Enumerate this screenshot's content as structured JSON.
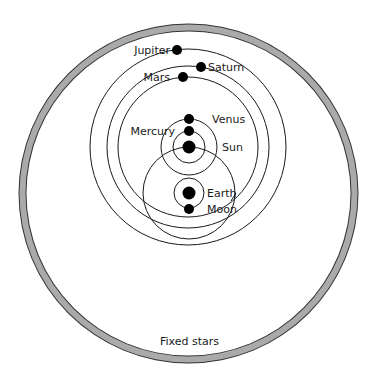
{
  "colors": {
    "background": "#ffffff",
    "line": "#1a1a1a",
    "body": "#000000",
    "ring_fill": "#aaaaaa",
    "ring_edge": "#333333"
  },
  "sphere_of_fixed_stars": {
    "label": "Fixed stars",
    "center": [
      188.5,
      193.5
    ],
    "outer_r": 170,
    "inner_r": 163,
    "label_pos": [
      189.5,
      345
    ]
  },
  "bodies": [
    {
      "name": "Sun",
      "label": "Sun",
      "x": 189,
      "y": 147,
      "r": 6.5,
      "label_x": 222,
      "label_y": 151,
      "anchor": "start"
    },
    {
      "name": "Earth",
      "label": "Earth",
      "x": 189,
      "y": 193,
      "r": 6.5,
      "label_x": 207,
      "label_y": 197,
      "anchor": "start"
    },
    {
      "name": "Moon",
      "label": "Moon",
      "x": 189,
      "y": 209,
      "r": 5,
      "label_x": 207,
      "label_y": 213,
      "anchor": "start"
    },
    {
      "name": "Mercury",
      "label": "Mercury",
      "x": 189,
      "y": 131,
      "r": 5,
      "label_x": 175,
      "label_y": 135,
      "anchor": "end"
    },
    {
      "name": "Venus",
      "label": "Venus",
      "x": 189,
      "y": 119,
      "r": 5,
      "label_x": 212,
      "label_y": 123,
      "anchor": "start"
    },
    {
      "name": "Mars",
      "label": "Mars",
      "x": 183,
      "y": 77,
      "r": 5,
      "label_x": 170,
      "label_y": 81,
      "anchor": "end"
    },
    {
      "name": "Jupiter",
      "label": "Jupiter",
      "x": 177,
      "y": 50,
      "r": 5,
      "label_x": 170,
      "label_y": 54,
      "anchor": "end"
    },
    {
      "name": "Saturn",
      "label": "Saturn",
      "x": 201,
      "y": 67,
      "r": 5,
      "label_x": 208,
      "label_y": 71,
      "anchor": "start"
    }
  ],
  "orbits": [
    {
      "name": "jupiter-orbit",
      "cx": 188,
      "cy": 147,
      "r": 98
    },
    {
      "name": "saturn-orbit",
      "cx": 188,
      "cy": 147,
      "r": 81
    },
    {
      "name": "mars-orbit",
      "cx": 188,
      "cy": 147,
      "r": 70
    },
    {
      "name": "venus-orbit",
      "cx": 189,
      "cy": 147,
      "r": 28
    },
    {
      "name": "mercury-orbit",
      "cx": 189,
      "cy": 147,
      "r": 16
    },
    {
      "name": "sun-orbit",
      "cx": 189,
      "cy": 193,
      "r": 46
    },
    {
      "name": "moon-orbit",
      "cx": 189,
      "cy": 193,
      "r": 15
    }
  ],
  "labels": {
    "jupiter": "Jupiter",
    "saturn": "Saturn",
    "mars": "Mars",
    "venus": "Venus",
    "mercury": "Mercury",
    "sun": "Sun",
    "earth": "Earth",
    "moon": "Moon",
    "fixed_stars": "Fixed stars"
  }
}
